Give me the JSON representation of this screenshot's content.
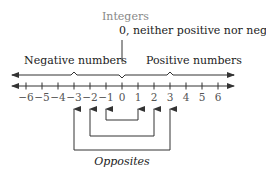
{
  "diagram": {
    "title": "Integers",
    "zero_note": "0,  neither positive nor negative",
    "negative_label": "Negative numbers",
    "positive_label": "Positive numbers",
    "opposites_label": "Opposites",
    "ticks": [
      "−6",
      "−5",
      "−4",
      "−3",
      "−2",
      "−1",
      "0",
      "1",
      "2",
      "3",
      "4",
      "5",
      "6"
    ],
    "opposite_pairs": [
      [
        -1,
        1
      ],
      [
        -2,
        2
      ],
      [
        -3,
        3
      ]
    ],
    "colors": {
      "line": "#333333",
      "title": "#888888",
      "text": "#222222",
      "tick_text": "#555555"
    }
  }
}
